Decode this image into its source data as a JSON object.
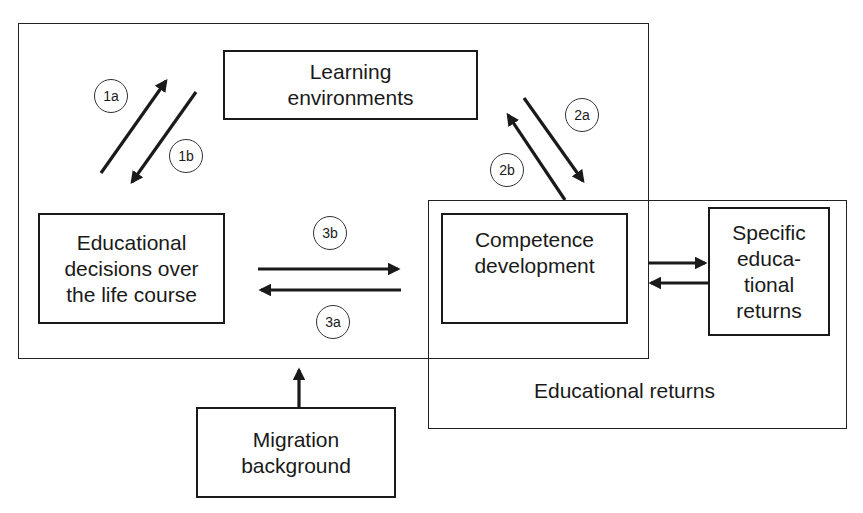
{
  "diagram": {
    "outer_frames": {
      "left_group": {
        "label": ""
      },
      "educational_returns": {
        "label": "Educational returns"
      }
    },
    "nodes": {
      "learning_environments": {
        "lines": [
          "Learning",
          "environments"
        ]
      },
      "educational_decisions": {
        "lines": [
          "Educational",
          "decisions over",
          "the life course"
        ]
      },
      "competence_development": {
        "lines": [
          "Competence",
          "development"
        ]
      },
      "specific_returns": {
        "lines": [
          "Specific",
          "educa-",
          "tional",
          "returns"
        ]
      },
      "migration_background": {
        "lines": [
          "Migration",
          "background"
        ]
      }
    },
    "badges": {
      "b1a": "1a",
      "b1b": "1b",
      "b2a": "2a",
      "b2b": "2b",
      "b3a": "3a",
      "b3b": "3b"
    },
    "edges": [
      {
        "id": "1a",
        "from": "educational_decisions",
        "to": "learning_environments"
      },
      {
        "id": "1b",
        "from": "learning_environments",
        "to": "educational_decisions"
      },
      {
        "id": "2a",
        "from": "learning_environments",
        "to": "competence_development"
      },
      {
        "id": "2b",
        "from": "competence_development",
        "to": "learning_environments"
      },
      {
        "id": "3b",
        "from": "educational_decisions",
        "to": "competence_development"
      },
      {
        "id": "3a",
        "from": "competence_development",
        "to": "educational_decisions"
      },
      {
        "id": "",
        "from": "competence_development",
        "to": "specific_returns"
      },
      {
        "id": "",
        "from": "specific_returns",
        "to": "competence_development"
      },
      {
        "id": "",
        "from": "migration_background",
        "to": "left_group"
      }
    ],
    "colors": {
      "stroke": "#1a1a1a",
      "background": "#ffffff"
    }
  }
}
